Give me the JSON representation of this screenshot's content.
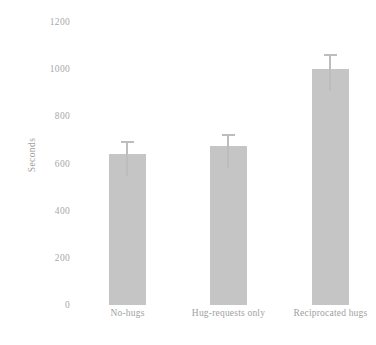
{
  "chart_data": {
    "type": "bar",
    "title": "",
    "xlabel": "",
    "ylabel": "Seconds",
    "categories": [
      "No-hugs",
      "Hug-requests only",
      "Reciprocated hugs"
    ],
    "values": [
      640,
      675,
      1000
    ],
    "errors": [
      45,
      40,
      55
    ],
    "ylim": [
      0,
      1200
    ],
    "yticks": [
      0,
      200,
      400,
      600,
      800,
      1000,
      1200
    ],
    "ytick_labels": [
      "0",
      "200",
      "400",
      "600",
      "800",
      "1000",
      "1200"
    ],
    "grid": false,
    "legend": "none",
    "series": [
      {
        "name": "Seconds",
        "values": [
          640,
          675,
          1000
        ],
        "errors": [
          45,
          40,
          55
        ],
        "color": "#c5c5c5"
      }
    ],
    "colors": {
      "bar_fill": "#c5c5c5",
      "error_bar": "#bdbdbd",
      "text": "#a0a0a0",
      "background": "#ffffff"
    }
  }
}
